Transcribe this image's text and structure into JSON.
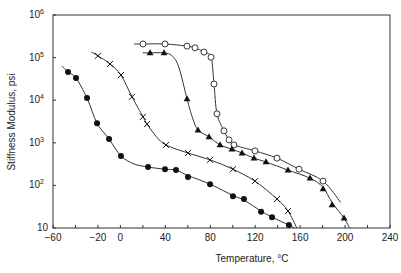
{
  "chart_data": {
    "type": "line",
    "title": "",
    "xlabel": "Temperature, °C",
    "ylabel": "Stiffness Modulus, psi",
    "xlim": [
      -60,
      240
    ],
    "ylim": [
      10,
      1000000
    ],
    "yscale": "log",
    "grid": false,
    "legend": null,
    "x_ticks": [
      -60,
      -40,
      -20,
      0,
      20,
      40,
      60,
      80,
      100,
      120,
      140,
      160,
      180,
      200,
      220,
      240
    ],
    "x_tick_labels": [
      {
        "value": -60,
        "label": "−60"
      },
      {
        "value": -20,
        "label": "−20"
      },
      {
        "value": 0,
        "label": "0"
      },
      {
        "value": 40,
        "label": "40"
      },
      {
        "value": 80,
        "label": "80"
      },
      {
        "value": 120,
        "label": "120"
      },
      {
        "value": 160,
        "label": "160"
      },
      {
        "value": 200,
        "label": "200"
      },
      {
        "value": 240,
        "label": "240"
      }
    ],
    "y_tick_labels": [
      {
        "value": 10,
        "base": "10",
        "exp": ""
      },
      {
        "value": 100,
        "base": "10",
        "exp": "2"
      },
      {
        "value": 1000,
        "base": "10",
        "exp": "3"
      },
      {
        "value": 10000,
        "base": "10",
        "exp": "4"
      },
      {
        "value": 100000,
        "base": "10",
        "exp": "5"
      },
      {
        "value": 1000000,
        "base": "10",
        "exp": "6"
      }
    ],
    "series": [
      {
        "name": "filled-circle",
        "marker": "filled-circle",
        "points": [
          [
            -46.6,
            45700
          ],
          [
            -39.5,
            33100
          ],
          [
            -29.7,
            11200
          ],
          [
            -20.8,
            2880
          ],
          [
            -10.1,
            1230
          ],
          [
            0.5,
            490
          ],
          [
            24.6,
            270
          ],
          [
            39.7,
            240
          ],
          [
            49.5,
            229
          ],
          [
            60.2,
            158
          ],
          [
            79.8,
            107
          ],
          [
            100.2,
            56
          ],
          [
            110.0,
            48
          ],
          [
            125.2,
            24
          ],
          [
            135.0,
            18
          ],
          [
            150.0,
            11.7
          ]
        ],
        "curve": [
          [
            -52,
            63000
          ],
          [
            -46.6,
            45700
          ],
          [
            -39.5,
            33100
          ],
          [
            -29.7,
            11200
          ],
          [
            -20.8,
            2880
          ],
          [
            -10.1,
            1230
          ],
          [
            0.5,
            490
          ],
          [
            12,
            320
          ],
          [
            24.6,
            270
          ],
          [
            39.7,
            240
          ],
          [
            49.5,
            229
          ],
          [
            60.2,
            170
          ],
          [
            79.8,
            107
          ],
          [
            100.2,
            58
          ],
          [
            110.0,
            45
          ],
          [
            125.2,
            25
          ],
          [
            135.0,
            18
          ],
          [
            150.0,
            11.7
          ],
          [
            155,
            10
          ]
        ]
      },
      {
        "name": "cross",
        "marker": "cross",
        "points": [
          [
            -20.0,
            110000
          ],
          [
            -9.3,
            70800
          ],
          [
            0.5,
            38900
          ],
          [
            10.3,
            12000
          ],
          [
            20.1,
            4070
          ],
          [
            23.7,
            2750
          ],
          [
            40.6,
            891
          ],
          [
            60.2,
            575
          ],
          [
            79.8,
            398
          ],
          [
            100.2,
            240
          ],
          [
            119.8,
            126
          ],
          [
            139.4,
            48
          ],
          [
            149.2,
            25
          ]
        ],
        "curve": [
          [
            -26,
            135000
          ],
          [
            -20.0,
            110000
          ],
          [
            -9.3,
            70800
          ],
          [
            0.5,
            38900
          ],
          [
            10.3,
            12000
          ],
          [
            20.1,
            4070
          ],
          [
            23.7,
            2750
          ],
          [
            32,
            1400
          ],
          [
            40.6,
            891
          ],
          [
            60.2,
            575
          ],
          [
            79.8,
            398
          ],
          [
            100.2,
            240
          ],
          [
            119.8,
            126
          ],
          [
            139.4,
            48
          ],
          [
            149.2,
            25
          ],
          [
            157,
            10
          ]
        ]
      },
      {
        "name": "open-circle",
        "marker": "open-circle",
        "points": [
          [
            20.1,
            209000
          ],
          [
            39.7,
            209000
          ],
          [
            59.3,
            186000
          ],
          [
            66.4,
            170000
          ],
          [
            74.4,
            135000
          ],
          [
            80.7,
            102000
          ],
          [
            83.3,
            24000
          ],
          [
            86.0,
            4790
          ],
          [
            92.2,
            1910
          ],
          [
            96.7,
            1170
          ],
          [
            101.1,
            891
          ],
          [
            119.8,
            646
          ],
          [
            139.4,
            437
          ],
          [
            159.0,
            240
          ],
          [
            180.4,
            126
          ]
        ],
        "curve": [
          [
            12,
            209000
          ],
          [
            20.1,
            209000
          ],
          [
            39.7,
            209000
          ],
          [
            59.3,
            186000
          ],
          [
            66.4,
            170000
          ],
          [
            74.4,
            135000
          ],
          [
            80.7,
            102000
          ],
          [
            83.3,
            24000
          ],
          [
            86.0,
            4790
          ],
          [
            92.2,
            1910
          ],
          [
            96.7,
            1170
          ],
          [
            101.1,
            891
          ],
          [
            119.8,
            646
          ],
          [
            139.4,
            437
          ],
          [
            159.0,
            240
          ],
          [
            180.4,
            126
          ],
          [
            196,
            40
          ]
        ]
      },
      {
        "name": "filled-triangle",
        "marker": "filled-triangle",
        "points": [
          [
            26.4,
            129000
          ],
          [
            38.8,
            129000
          ],
          [
            59.3,
            10700
          ],
          [
            69.1,
            2000
          ],
          [
            78.9,
            1380
          ],
          [
            88.7,
            891
          ],
          [
            99.3,
            708
          ],
          [
            108.3,
            575
          ],
          [
            118.9,
            437
          ],
          [
            129.6,
            355
          ],
          [
            149.2,
            229
          ],
          [
            168.8,
            148
          ],
          [
            180.4,
            83
          ],
          [
            188.4,
            35
          ],
          [
            199.1,
            17
          ]
        ],
        "curve": [
          [
            20,
            130000
          ],
          [
            26.4,
            129000
          ],
          [
            38.8,
            129000
          ],
          [
            46,
            110000
          ],
          [
            52,
            60000
          ],
          [
            59.3,
            10700
          ],
          [
            64,
            4000
          ],
          [
            69.1,
            2000
          ],
          [
            78.9,
            1380
          ],
          [
            88.7,
            891
          ],
          [
            99.3,
            708
          ],
          [
            108.3,
            575
          ],
          [
            118.9,
            437
          ],
          [
            129.6,
            355
          ],
          [
            149.2,
            229
          ],
          [
            168.8,
            148
          ],
          [
            180.4,
            90
          ],
          [
            188.4,
            40
          ],
          [
            199.1,
            17
          ],
          [
            204,
            10
          ]
        ]
      }
    ]
  },
  "axes": {
    "x_title": "Temperature, °C",
    "y_title": "Stiffness Modulus, psi"
  }
}
